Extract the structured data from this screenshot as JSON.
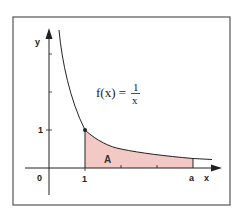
{
  "diagram": {
    "axes": {
      "x_label": "x",
      "y_label": "y",
      "origin_label": "0",
      "x_tick_labels": [
        "1",
        "a"
      ],
      "y_tick_labels": [
        "1"
      ]
    },
    "function": {
      "lhs": "f(x) =",
      "numerator": "1",
      "denominator": "x"
    },
    "region": {
      "label": "A",
      "from": "1",
      "to": "a"
    },
    "colors": {
      "area_fill": "#f2c9c4",
      "curve": "#222222",
      "axes": "#222222",
      "frame": "#444444",
      "background": "#ffffff"
    }
  }
}
